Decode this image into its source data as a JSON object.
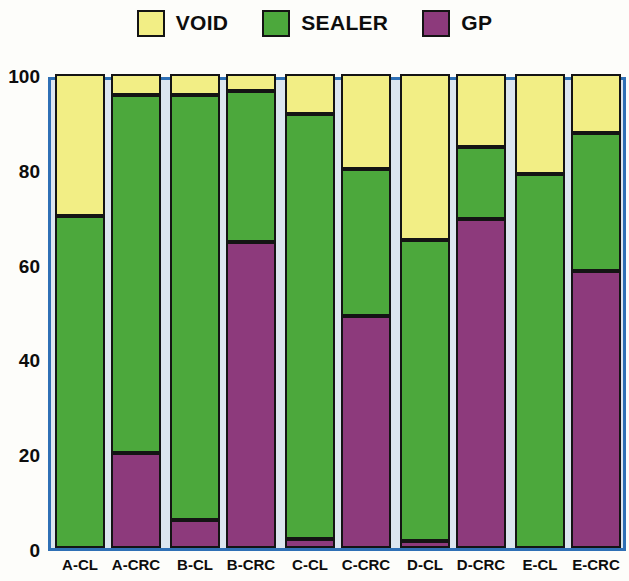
{
  "legend": {
    "items": [
      {
        "label": "VOID",
        "color": "#f2ee85"
      },
      {
        "label": "SEALER",
        "color": "#4ca83c"
      },
      {
        "label": "GP",
        "color": "#8d3a7c"
      }
    ]
  },
  "axis": {
    "y_ticks": [
      "0",
      "20",
      "40",
      "60",
      "80",
      "100"
    ],
    "frame_color": "#2f70b5",
    "plot_background": "#dce6ef"
  },
  "chart_data": {
    "type": "bar",
    "stacked": true,
    "title": "",
    "xlabel": "",
    "ylabel": "",
    "ylim": [
      0,
      100
    ],
    "yticks": [
      0,
      20,
      40,
      60,
      80,
      100
    ],
    "grid": false,
    "legend_position": "top-center",
    "categories": [
      "A-CL",
      "A-CRC",
      "B-CL",
      "B-CRC",
      "C-CL",
      "C-CRC",
      "D-CL",
      "D-CRC",
      "E-CL",
      "E-CRC"
    ],
    "series": [
      {
        "name": "GP",
        "color": "#8d3a7c",
        "values": [
          0,
          20,
          6,
          64.5,
          2,
          49,
          1.5,
          69.5,
          0,
          58.5
        ]
      },
      {
        "name": "SEALER",
        "color": "#4ca83c",
        "values": [
          70,
          75.5,
          89.5,
          32,
          89.5,
          31,
          63.5,
          15,
          79,
          29
        ]
      },
      {
        "name": "VOID",
        "color": "#f2ee85",
        "values": [
          30,
          4.5,
          4.5,
          3.5,
          8.5,
          20,
          35,
          15.5,
          21,
          12.5
        ]
      }
    ],
    "cumulative_tops": {
      "GP": [
        0,
        20,
        6,
        64.5,
        2,
        49,
        1.5,
        69.5,
        0,
        58.5
      ],
      "SEALER": [
        70,
        95.5,
        95.5,
        96.5,
        91.5,
        80,
        65,
        84.5,
        79,
        87.5
      ],
      "VOID": [
        100,
        100,
        100,
        100,
        100,
        100,
        100,
        100,
        100,
        100
      ]
    }
  }
}
